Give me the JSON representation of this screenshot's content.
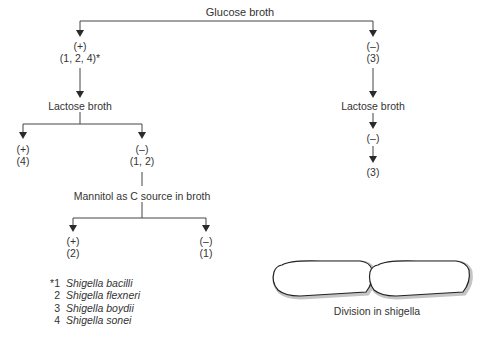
{
  "diagram": {
    "title": "Glucose broth",
    "glucose_positive": {
      "result": "(+)",
      "species": "(1, 2, 4)*"
    },
    "glucose_negative": {
      "result": "(–)",
      "species": "(3)"
    },
    "left_branch": {
      "test": "Lactose broth",
      "positive": {
        "result": "(+)",
        "species": "(4)"
      },
      "negative": {
        "result": "(–)",
        "species": "(1, 2)"
      },
      "sub_test": {
        "test": "Mannitol as C source in broth",
        "positive": {
          "result": "(+)",
          "species": "(2)"
        },
        "negative": {
          "result": "(–)",
          "species": "(1)"
        }
      }
    },
    "right_branch": {
      "test": "Lactose broth",
      "result": "(–)",
      "species": "(3)"
    },
    "legend": [
      {
        "num": "*1",
        "name": "Shigella bacilli"
      },
      {
        "num": "2",
        "name": "Shigella flexneri"
      },
      {
        "num": "3",
        "name": "Shigella boydii"
      },
      {
        "num": "4",
        "name": "Shigella sonei"
      }
    ],
    "illustration": {
      "caption": "Division in shigella"
    }
  },
  "colors": {
    "line": "#3a3a3a",
    "text": "#333333",
    "cell_outline": "#222222",
    "cell_shadow": "#bdbdbd"
  }
}
